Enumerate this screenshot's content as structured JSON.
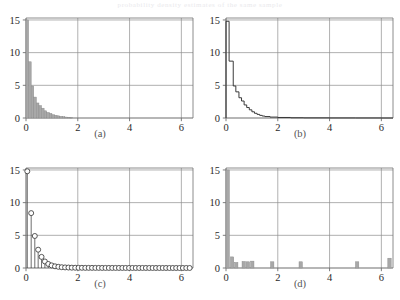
{
  "figure": {
    "title_bleed": "probability density estimates of the same sample",
    "panel_count": 4,
    "layout": "2x2"
  },
  "captions": {
    "a": "(a)",
    "b": "(b)",
    "c": "(c)",
    "d": "(d)"
  },
  "axes": {
    "x_ticks": [
      "0",
      "2",
      "4",
      "6"
    ],
    "y_ticks": [
      "0",
      "5",
      "10",
      "15"
    ],
    "x_tick_values": [
      0,
      2,
      4,
      6
    ],
    "y_tick_values": [
      0,
      5,
      10,
      15
    ],
    "xlim": [
      0,
      6.45
    ],
    "ylim": [
      0,
      15.3
    ],
    "grid": true,
    "grid_color": "#8e8e8e",
    "frame_color": "#6f6f6f"
  },
  "style": {
    "bar_fill": "#a8a8a8",
    "bar_stroke": "#8a8a8a",
    "step_line": "#303030",
    "stem_line": "#303030",
    "marker_stroke": "#303030",
    "marker_fill": "#ffffff"
  },
  "chart_data": [
    {
      "type": "bar",
      "panel": "a",
      "title": "(a)",
      "xlabel": "",
      "ylabel": "",
      "xlim": [
        0,
        6.45
      ],
      "ylim": [
        0,
        15.3
      ],
      "x_ticks": [
        0,
        2,
        4,
        6
      ],
      "y_ticks": [
        0,
        5,
        10,
        15
      ],
      "grid": true,
      "bin_width": 0.1,
      "bin_left_edges": [
        0.0,
        0.1,
        0.2,
        0.3,
        0.4,
        0.5,
        0.6,
        0.7,
        0.8,
        0.9,
        1.0,
        1.1,
        1.2,
        1.3,
        1.4,
        1.5,
        1.6,
        1.7
      ],
      "values": [
        15.0,
        8.6,
        4.9,
        3.2,
        2.3,
        1.9,
        1.5,
        1.1,
        0.85,
        0.7,
        0.5,
        0.42,
        0.33,
        0.26,
        0.2,
        0.14,
        0.1,
        0.06
      ]
    },
    {
      "type": "line",
      "panel": "b",
      "title": "(b)",
      "xlabel": "",
      "ylabel": "",
      "xlim": [
        0,
        6.45
      ],
      "ylim": [
        0,
        15.3
      ],
      "x_ticks": [
        0,
        2,
        4,
        6
      ],
      "y_ticks": [
        0,
        5,
        10,
        15
      ],
      "grid": true,
      "style": "step",
      "x": [
        0.0,
        0.12,
        0.28,
        0.38,
        0.5,
        0.6,
        0.7,
        0.8,
        0.9,
        1.0,
        1.1,
        1.2,
        1.3,
        1.4,
        1.5,
        1.7,
        2.0,
        2.5,
        3.0,
        4.0,
        5.0,
        6.0,
        6.45
      ],
      "values": [
        14.8,
        8.7,
        4.9,
        4.0,
        3.1,
        2.6,
        2.0,
        1.6,
        1.25,
        0.95,
        0.72,
        0.55,
        0.4,
        0.3,
        0.22,
        0.14,
        0.08,
        0.04,
        0.02,
        0.01,
        0.005,
        0.0,
        0.0
      ]
    },
    {
      "type": "scatter",
      "panel": "c",
      "title": "(c)",
      "xlabel": "",
      "ylabel": "",
      "xlim": [
        0,
        6.45
      ],
      "ylim": [
        0,
        15.3
      ],
      "x_ticks": [
        0,
        2,
        4,
        6
      ],
      "y_ticks": [
        0,
        5,
        10,
        15
      ],
      "grid": true,
      "style": "stem-with-open-circles",
      "x": [
        0.05,
        0.2,
        0.34,
        0.47,
        0.6,
        0.73,
        0.86,
        0.99,
        1.12,
        1.25,
        1.38,
        1.51,
        1.64,
        1.77,
        1.9,
        2.03,
        2.16,
        2.29,
        2.42,
        2.55,
        2.68,
        2.81,
        2.94,
        3.07,
        3.2,
        3.33,
        3.46,
        3.59,
        3.72,
        3.85,
        3.98,
        4.11,
        4.24,
        4.37,
        4.5,
        4.63,
        4.76,
        4.89,
        5.02,
        5.15,
        5.28,
        5.41,
        5.54,
        5.67,
        5.8,
        5.93,
        6.06,
        6.19,
        6.32
      ],
      "values": [
        14.8,
        8.4,
        4.9,
        2.8,
        1.7,
        1.0,
        0.62,
        0.4,
        0.26,
        0.18,
        0.12,
        0.09,
        0.07,
        0.05,
        0.04,
        0.03,
        0.03,
        0.02,
        0.02,
        0.02,
        0.015,
        0.015,
        0.01,
        0.01,
        0.01,
        0.01,
        0.01,
        0.008,
        0.008,
        0.008,
        0.006,
        0.006,
        0.006,
        0.005,
        0.005,
        0.005,
        0.004,
        0.004,
        0.004,
        0.003,
        0.003,
        0.003,
        0.002,
        0.002,
        0.002,
        0.002,
        0.001,
        0.001,
        0.001
      ]
    },
    {
      "type": "bar",
      "panel": "d",
      "title": "(d)",
      "xlabel": "",
      "ylabel": "",
      "xlim": [
        0,
        6.45
      ],
      "ylim": [
        0,
        15.3
      ],
      "x_ticks": [
        0,
        2,
        4,
        6
      ],
      "y_ticks": [
        0,
        5,
        10,
        15
      ],
      "grid": true,
      "bin_width": 0.13,
      "bin_left_edges": [
        0.0,
        0.17,
        0.33,
        0.62,
        0.78,
        0.95,
        1.72,
        2.82,
        5.0,
        6.25
      ],
      "values": [
        15.0,
        1.7,
        0.85,
        1.0,
        0.95,
        1.05,
        0.95,
        0.95,
        0.95,
        1.5
      ]
    }
  ]
}
